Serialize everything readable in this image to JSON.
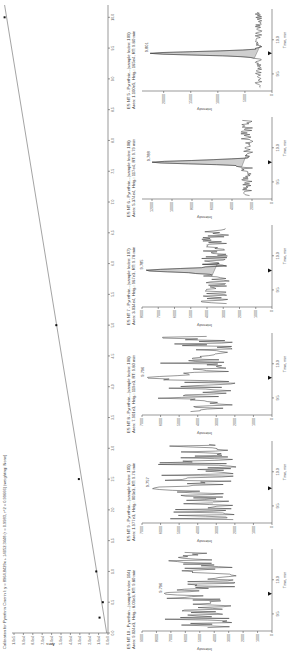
{
  "calibration": {
    "title": "Calibration for Pyrethrin Cinerin I: y = 8964.8429x + 14052.3448 (r = 0.9983, r^2 = 0.99666) (weighting: None)",
    "ylabel": "Area",
    "xlabel": "Concentration (mg/mL)",
    "y_ticks": [
      "0.0e0",
      "1.0e4",
      "2.0e4",
      "3.0e4",
      "4.0e4",
      "5.0e4",
      "6.0e4",
      "7.0e4",
      "8.0e4",
      "9.0e4",
      "1.0e5"
    ],
    "x_ticks": [
      "0.0",
      "0.5",
      "1.0",
      "1.5",
      "2.0",
      "2.5",
      "3.0",
      "3.5",
      "4.0",
      "4.5",
      "5.0",
      "5.5",
      "6.0",
      "6.5",
      "7.0",
      "7.5",
      "8.0",
      "8.5",
      "9.0",
      "9.5",
      "10.0"
    ]
  },
  "panels": [
    {
      "title": "ES NT 10 - Pyrethrin...(sample Index: 104)",
      "subtitle": "Area: 9.024e3, Heig.: 8.03e3, RT: 9.80 min",
      "peak_label": "9.796",
      "y_ticks": [
        "0",
        "1000",
        "2000",
        "3000",
        "4000",
        "5000",
        "6000",
        "7000",
        "8000",
        "9000"
      ],
      "ylabel": "Intensity",
      "x_ticks": [
        "9.5",
        "10.0"
      ],
      "xlabel": "Time, min"
    },
    {
      "title": "ES NT 9 - Pyrethrin...(sample Index: 105)",
      "subtitle": "Area: 1.977e3, Heig.: 003e3, RT: 9.76 min",
      "peak_label": "9.757",
      "y_ticks": [
        "0",
        "1000",
        "2000",
        "3000",
        "4000",
        "5000",
        "6000",
        "7000"
      ],
      "ylabel": "Intensity",
      "x_ticks": [
        "9.5",
        "10.0"
      ],
      "xlabel": "Time, min"
    },
    {
      "title": "ES NT 8 - Pyrethrin...(sample Index: 106)",
      "subtitle": "Area: 7.901e3, Heig.: 119e3, RT: 9.80 min",
      "peak_label": "9.796",
      "y_ticks": [
        "0",
        "1000",
        "2000",
        "3000",
        "4000",
        "5000",
        "6000",
        "7000"
      ],
      "ylabel": "Intensity",
      "x_ticks": [
        "9.5",
        "10.0"
      ],
      "xlabel": "Time, min"
    },
    {
      "title": "ES NT 7 - Pyrethrin...(sample Index: 107)",
      "subtitle": "Area: 3.034e4, Heig.: 967e3, RT: 9.78 min",
      "peak_label": "9.785",
      "y_ticks": [
        "0",
        "1000",
        "2000",
        "3000",
        "4000",
        "5000",
        "6000",
        "7000",
        "8000"
      ],
      "ylabel": "Intensity",
      "x_ticks": [
        "9.5",
        "10.0"
      ],
      "xlabel": "Time, min"
    },
    {
      "title": "ES NT 6 - Pyrethrin...(sample Index: 108)",
      "subtitle": "Area: 5.374e4, Heig.: 117e4, RT: 9.79 min",
      "peak_label": "9.788",
      "y_ticks": [
        "0",
        "2000",
        "4000",
        "6000",
        "8000",
        "10000",
        "12000"
      ],
      "ylabel": "Intensity",
      "x_ticks": [
        "9.5",
        "10.0"
      ],
      "xlabel": "Time, min"
    },
    {
      "title": "ES NT 5 - Pyrethrin...(sample Index: 109)",
      "subtitle": "Area: 1.100e5, Heig.: 165e4, RT: 9.80 min",
      "peak_label": "9.801",
      "y_ticks": [
        "0",
        "5000",
        "10000",
        "15000",
        "20000"
      ],
      "ylabel": "Intensity",
      "x_ticks": [
        "9.5",
        "10.0"
      ],
      "xlabel": "Time, min"
    }
  ],
  "chart_data": [
    {
      "type": "scatter",
      "title": "Calibration for Pyrethrin Cinerin I (linear fit)",
      "xlabel": "Concentration (mg/mL)",
      "ylabel": "Area",
      "xlim": [
        0,
        10.2
      ],
      "ylim": [
        0,
        100000
      ],
      "points": [
        {
          "x": 0.25,
          "y": 9000
        },
        {
          "x": 0.5,
          "y": 5500
        },
        {
          "x": 1.0,
          "y": 12500
        },
        {
          "x": 2.5,
          "y": 31000
        },
        {
          "x": 5.0,
          "y": 55000
        },
        {
          "x": 10.0,
          "y": 110000
        }
      ],
      "fit_line": {
        "x0": 0,
        "y0": 1400,
        "x1": 10.2,
        "y1": 110000
      }
    },
    {
      "type": "line",
      "title": "ES NT 10 - Pyrethrin (sample Index: 104)",
      "xlabel": "Time, min",
      "ylabel": "Intensity",
      "x": [
        9.3,
        9.5,
        9.7,
        9.796,
        9.9,
        10.0,
        10.2,
        10.4
      ],
      "values": [
        4500,
        5200,
        6000,
        7500,
        5200,
        6500,
        7200,
        4500
      ],
      "ylim": [
        0,
        9000
      ],
      "rt": 9.796
    },
    {
      "type": "line",
      "title": "ES NT 9 - Pyrethrin (sample Index: 105)",
      "xlabel": "Time, min",
      "ylabel": "Intensity",
      "x": [
        9.3,
        9.5,
        9.757,
        9.9,
        10.0,
        10.2,
        10.4
      ],
      "values": [
        3500,
        4500,
        6500,
        5200,
        5500,
        5000,
        4200
      ],
      "ylim": [
        0,
        7000
      ],
      "rt": 9.757
    },
    {
      "type": "line",
      "title": "ES NT 8 - Pyrethrin (sample Index: 106)",
      "xlabel": "Time, min",
      "ylabel": "Intensity",
      "x": [
        9.3,
        9.5,
        9.7,
        9.796,
        9.9,
        10.0,
        10.2,
        10.4
      ],
      "values": [
        3500,
        4500,
        5000,
        6800,
        5000,
        5200,
        4800,
        4500
      ],
      "ylim": [
        0,
        7000
      ],
      "rt": 9.796
    },
    {
      "type": "line",
      "title": "ES NT 7 - Pyrethrin (sample Index: 107)",
      "xlabel": "Time, min",
      "ylabel": "Intensity",
      "x": [
        9.3,
        9.5,
        9.785,
        9.9,
        10.0,
        10.2,
        10.4
      ],
      "values": [
        3500,
        3800,
        7800,
        5000,
        4800,
        5200,
        4500
      ],
      "ylim": [
        0,
        8000
      ],
      "rt": 9.785
    },
    {
      "type": "line",
      "title": "ES NT 6 - Pyrethrin (sample Index: 108)",
      "xlabel": "Time, min",
      "ylabel": "Intensity",
      "x": [
        9.3,
        9.5,
        9.788,
        9.9,
        10.0,
        10.2,
        10.4
      ],
      "values": [
        2500,
        3000,
        12000,
        3500,
        4000,
        4200,
        3800
      ],
      "ylim": [
        0,
        13000
      ],
      "rt": 9.788
    },
    {
      "type": "line",
      "title": "ES NT 5 - Pyrethrin (sample Index: 109)",
      "xlabel": "Time, min",
      "ylabel": "Intensity",
      "x": [
        9.3,
        9.5,
        9.801,
        9.9,
        10.0,
        10.2,
        10.4
      ],
      "values": [
        2500,
        2800,
        22500,
        3000,
        3200,
        3500,
        3000
      ],
      "ylim": [
        0,
        24000
      ],
      "rt": 9.801
    }
  ]
}
